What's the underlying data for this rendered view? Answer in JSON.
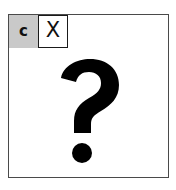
{
  "canvas": {
    "width": 176,
    "height": 190,
    "background_color": "#ffffff"
  },
  "frame": {
    "border_color": "#4a4a4a",
    "fill_color": "#ffffff"
  },
  "header": {
    "background_color": "#c9c9c9",
    "letter_label": "c",
    "close_button": {
      "label": "X",
      "icon_name": "close-icon",
      "border_color": "#1a1a1a",
      "fill_color": "#ffffff"
    }
  },
  "body": {
    "icon_name": "question-mark-icon",
    "glyph": "?",
    "color": "#000000",
    "description": "Broken image placeholder question mark"
  }
}
